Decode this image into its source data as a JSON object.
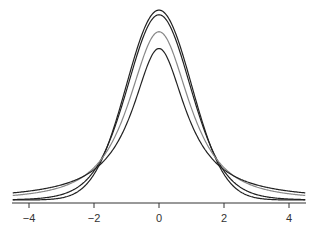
{
  "chart_data": {
    "type": "line",
    "title": "",
    "xlabel": "",
    "ylabel": "",
    "xlim": [
      -4.5,
      4.5
    ],
    "ylim": [
      0,
      0.4
    ],
    "grid": false,
    "legend": null,
    "x_ticks": [
      "−4",
      "−2",
      "0",
      "2",
      "4"
    ],
    "x_tick_values": [
      -4,
      -2,
      0,
      2,
      4
    ],
    "series": [
      {
        "name": "Normal",
        "distribution": "normal",
        "peak": 0.399,
        "color": "#222222"
      },
      {
        "name": "t (df=10)",
        "distribution": "t",
        "df": 10,
        "peak": 0.389,
        "color": "#222222"
      },
      {
        "name": "t (df=2)",
        "distribution": "t",
        "df": 2,
        "peak": 0.354,
        "color": "#888888"
      },
      {
        "name": "t (df=1)",
        "distribution": "t",
        "df": 1,
        "peak": 0.318,
        "color": "#222222"
      }
    ]
  }
}
